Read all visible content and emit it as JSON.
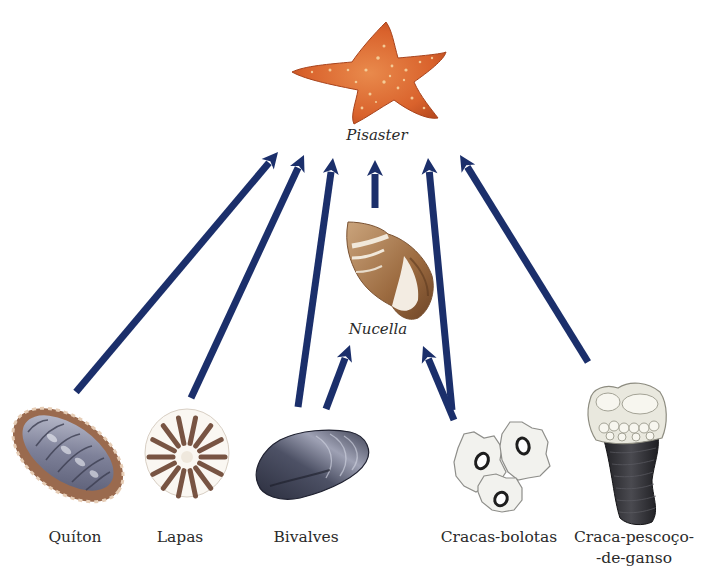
{
  "diagram": {
    "type": "food-web",
    "arrow_color": "#1b2f6b",
    "nodes": {
      "pisaster": {
        "label": "Pisaster",
        "italic": true,
        "level": "top-predator",
        "color": "#e0733a"
      },
      "nucella": {
        "label": "Nucella",
        "italic": true,
        "level": "intermediate-predator",
        "color": "#a87a4e"
      },
      "quiton": {
        "label": "Quíton",
        "italic": false,
        "level": "prey",
        "color": "#8c8fa6"
      },
      "lapas": {
        "label": "Lapas",
        "italic": false,
        "level": "prey",
        "color": "#6b4331"
      },
      "bivalves": {
        "label": "Bivalves",
        "italic": false,
        "level": "prey",
        "color": "#3a3d4f"
      },
      "cracas_bolotas": {
        "label": "Cracas-bolotas",
        "italic": false,
        "level": "prey",
        "color": "#eeeeea"
      },
      "craca_pescoco": {
        "label_line1": "Craca-pescoço-",
        "label_line2": "-de-ganso",
        "italic": false,
        "level": "prey",
        "color": "#38383d"
      }
    },
    "edges": [
      {
        "from": "quiton",
        "to": "pisaster"
      },
      {
        "from": "lapas",
        "to": "pisaster"
      },
      {
        "from": "bivalves",
        "to": "pisaster"
      },
      {
        "from": "nucella",
        "to": "pisaster"
      },
      {
        "from": "cracas_bolotas",
        "to": "pisaster"
      },
      {
        "from": "craca_pescoco",
        "to": "pisaster"
      },
      {
        "from": "bivalves",
        "to": "nucella"
      },
      {
        "from": "cracas_bolotas",
        "to": "nucella"
      }
    ]
  }
}
